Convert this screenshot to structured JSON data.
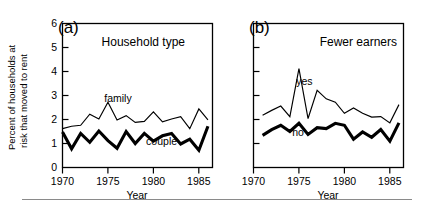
{
  "figure": {
    "background_color": "#ffffff",
    "line_color": "#000000",
    "rule_color": "#8a8a8a"
  },
  "axis": {
    "xlabel": "Year",
    "ylabel_line1": "Percent of households at",
    "ylabel_line2": "risk that moved to rent",
    "xticks": [
      "1970",
      "1975",
      "1980",
      "1985"
    ],
    "yticks": [
      "0",
      "1",
      "2",
      "3",
      "4",
      "5",
      "6"
    ]
  },
  "chart_data": [
    {
      "type": "line",
      "panel": "(a)",
      "title": "Household type",
      "xlabel": "Year",
      "ylabel": "Percent of households at risk that moved to rent",
      "xlim": [
        1970,
        1986.5
      ],
      "ylim": [
        0,
        6
      ],
      "xticks": [
        1970,
        1975,
        1980,
        1985
      ],
      "yticks": [
        0,
        1,
        2,
        3,
        4,
        5,
        6
      ],
      "grid": false,
      "legend": "inline-labels",
      "x": [
        1970,
        1971,
        1972,
        1973,
        1974,
        1975,
        1976,
        1977,
        1978,
        1979,
        1980,
        1981,
        1982,
        1983,
        1984,
        1985,
        1986
      ],
      "series": [
        {
          "name": "family",
          "style": "thin",
          "label_x": 1976.1,
          "label_y": 2.72,
          "values": [
            1.62,
            1.72,
            1.76,
            2.22,
            2.02,
            2.72,
            1.98,
            2.16,
            1.88,
            1.92,
            2.32,
            1.9,
            2.02,
            2.12,
            1.62,
            2.44,
            1.98
          ]
        },
        {
          "name": "couple",
          "style": "thick",
          "label_x": 1980.9,
          "label_y": 0.93,
          "values": [
            1.48,
            0.78,
            1.42,
            1.05,
            1.52,
            1.12,
            0.8,
            1.5,
            1.0,
            1.42,
            1.1,
            1.32,
            1.42,
            0.98,
            1.18,
            0.72,
            1.72
          ]
        }
      ]
    },
    {
      "type": "line",
      "panel": "(b)",
      "title": "Fewer earners",
      "xlabel": "Year",
      "ylabel": "Percent of households at risk that moved to rent",
      "xlim": [
        1970,
        1986.5
      ],
      "ylim": [
        0,
        6
      ],
      "xticks": [
        1970,
        1975,
        1980,
        1985
      ],
      "yticks": [
        0,
        1,
        2,
        3,
        4,
        5,
        6
      ],
      "grid": false,
      "legend": "inline-labels",
      "x": [
        1971,
        1972,
        1973,
        1974,
        1975,
        1976,
        1977,
        1978,
        1979,
        1980,
        1981,
        1982,
        1983,
        1984,
        1985,
        1986
      ],
      "series": [
        {
          "name": "yes",
          "style": "thin",
          "label_x": 1975.6,
          "label_y": 3.42,
          "values": [
            2.18,
            2.38,
            2.56,
            2.12,
            4.12,
            2.04,
            3.22,
            2.86,
            2.72,
            2.26,
            2.48,
            2.26,
            2.1,
            2.12,
            1.86,
            2.62
          ]
        },
        {
          "name": "no",
          "style": "thick",
          "label_x": 1974.9,
          "label_y": 1.3,
          "values": [
            1.34,
            1.58,
            1.76,
            1.5,
            1.84,
            1.38,
            1.66,
            1.62,
            1.84,
            1.76,
            1.18,
            1.48,
            1.26,
            1.58,
            1.1,
            1.86
          ]
        }
      ]
    }
  ]
}
